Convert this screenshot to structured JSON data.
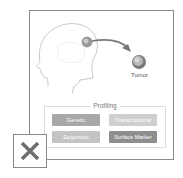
{
  "diagram": {
    "tumor_label": "Tumor",
    "profiling": {
      "title": "Profiling",
      "chips": [
        {
          "label": "Genetic",
          "color": "#a8a8a8"
        },
        {
          "label": "Transcriptional",
          "color": "#cfcfcf"
        },
        {
          "label": "Epigenetic",
          "color": "#c4c4c4"
        },
        {
          "label": "Surface Marker",
          "color": "#8e8e8e"
        }
      ]
    }
  },
  "close_button": {
    "icon": "close-icon",
    "color": "#6e6e6e"
  }
}
